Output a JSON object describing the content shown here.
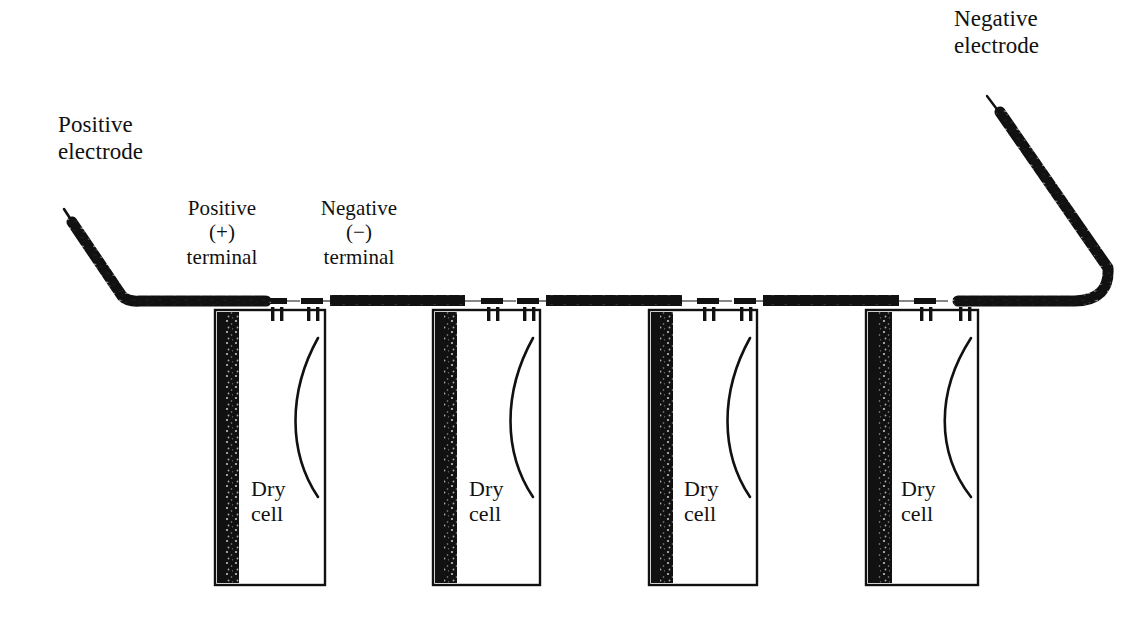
{
  "diagram": {
    "background_color": "#ffffff",
    "ink_color": "#111111",
    "labels": {
      "positive_electrode": "Positive\nelectrode",
      "negative_electrode": "Negative\nelectrode",
      "positive_terminal": "Positive\n(+)\nterminal",
      "negative_terminal": "Negative\n(−)\nterminal"
    },
    "cells": [
      {
        "label": "Dry\ncell",
        "x": 215,
        "y": 310,
        "width": 110,
        "height": 275
      },
      {
        "label": "Dry\ncell",
        "x": 433,
        "y": 310,
        "width": 107,
        "height": 275
      },
      {
        "label": "Dry\ncell",
        "x": 649,
        "y": 310,
        "width": 108,
        "height": 275
      },
      {
        "label": "Dry\ncell",
        "x": 866,
        "y": 310,
        "width": 112,
        "height": 275
      }
    ],
    "terminals": [
      {
        "cell": 1,
        "polarity": "positive",
        "symbol": "+"
      },
      {
        "cell": 1,
        "polarity": "negative",
        "symbol": "−"
      },
      {
        "cell": 2,
        "polarity": "positive",
        "symbol": "+"
      },
      {
        "cell": 2,
        "polarity": "negative",
        "symbol": "−"
      },
      {
        "cell": 3,
        "polarity": "positive",
        "symbol": "+"
      },
      {
        "cell": 3,
        "polarity": "negative",
        "symbol": "−"
      },
      {
        "cell": 4,
        "polarity": "positive",
        "symbol": "+"
      },
      {
        "cell": 4,
        "polarity": "negative",
        "symbol": "−"
      }
    ],
    "wires": [
      {
        "name": "positive-electrode-lead",
        "from": "external",
        "to": "cell-1-positive"
      },
      {
        "name": "link-cell1-cell2",
        "from": "cell-1-negative",
        "to": "cell-2-positive"
      },
      {
        "name": "link-cell2-cell3",
        "from": "cell-2-negative",
        "to": "cell-3-positive"
      },
      {
        "name": "link-cell3-cell4",
        "from": "cell-3-negative",
        "to": "cell-4-positive"
      },
      {
        "name": "negative-electrode-lead",
        "from": "cell-4-negative",
        "to": "external"
      }
    ]
  }
}
